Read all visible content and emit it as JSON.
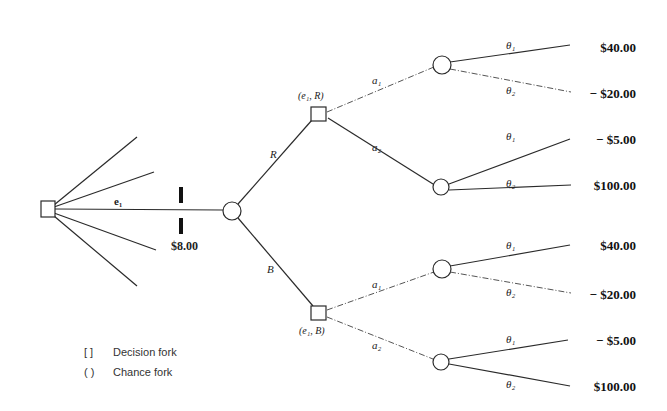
{
  "diagram": {
    "type": "decision-tree",
    "root_node": {
      "kind": "decision",
      "label": ""
    },
    "experiment_edge": {
      "label": "e₁",
      "cost": "$8.00"
    },
    "experiment_outcome_node": {
      "kind": "chance"
    },
    "outcomes": [
      {
        "edge_label": "R",
        "node_label": "(e₁, R)"
      },
      {
        "edge_label": "B",
        "node_label": "(e₁, B)"
      }
    ],
    "actions": [
      "a₁",
      "a₂"
    ],
    "states": [
      "θ₁",
      "θ₂"
    ],
    "payoffs": [
      {
        "outcome": "R",
        "action": "a₁",
        "state": "θ₁",
        "value": "$40.00"
      },
      {
        "outcome": "R",
        "action": "a₁",
        "state": "θ₂",
        "value": "$20.00"
      },
      {
        "outcome": "R",
        "action": "a₂",
        "state": "θ₁",
        "value": "− $5.00"
      },
      {
        "outcome": "R",
        "action": "a₂",
        "state": "θ₂",
        "value": "$100.00"
      },
      {
        "outcome": "B",
        "action": "a₁",
        "state": "θ₁",
        "value": "$40.00"
      },
      {
        "outcome": "B",
        "action": "a₁",
        "state": "θ₂",
        "value": "$20.00"
      },
      {
        "outcome": "B",
        "action": "a₂",
        "state": "θ₁",
        "value": "− $5.00"
      },
      {
        "outcome": "B",
        "action": "a₂",
        "state": "θ₂",
        "value": "$100.00"
      }
    ]
  },
  "labels": {
    "e1": "e₁",
    "cost": "$8.00",
    "R": "R",
    "B": "B",
    "node_R": "(e₁, R)",
    "node_B": "(e₁, B)",
    "a1": "a₁",
    "a2": "a₂",
    "theta1": "θ₁",
    "theta2": "θ₂"
  },
  "payoff_values": [
    "$40.00",
    "− $20.00",
    "− $5.00",
    "$100.00",
    "$40.00",
    "− $20.00",
    "− $5.00",
    "$100.00"
  ],
  "legend": {
    "decision_symbol": "[ ]",
    "decision_label": "Decision fork",
    "chance_symbol": "( )",
    "chance_label": "Chance fork"
  }
}
